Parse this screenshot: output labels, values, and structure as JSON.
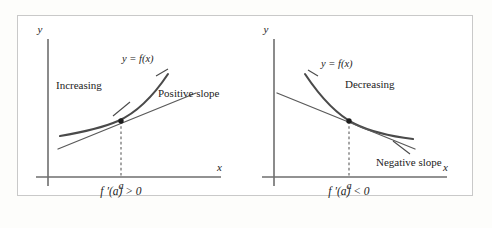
{
  "figure": {
    "kind": "calculus-derivative-sign-illustration",
    "panel_count": 2
  },
  "panels": [
    {
      "id": "increasing-panel",
      "axis_y_label": "y",
      "axis_x_label": "x",
      "function_label": "y = f(x)",
      "behavior_label": "Increasing",
      "slope_label": "Positive slope",
      "tick_label": "a",
      "formula_label": "f ′(a) > 0"
    },
    {
      "id": "decreasing-panel",
      "axis_y_label": "y",
      "axis_x_label": "x",
      "function_label": "y = f(x)",
      "behavior_label": "Decreasing",
      "slope_label": "Negative slope",
      "tick_label": "a",
      "formula_label": "f ′(a) < 0"
    }
  ],
  "colors": {
    "page_background": "#fdfdfb",
    "panel_background": "#ffffff",
    "frame_border": "#c9c9c9",
    "axis": "#6e6e6e",
    "curve": "#4a4a4a",
    "tangent": "#5a5a5a",
    "dashed_drop": "#6a6a6a",
    "point_marker": "#1d1d1d",
    "text": "#232323"
  }
}
